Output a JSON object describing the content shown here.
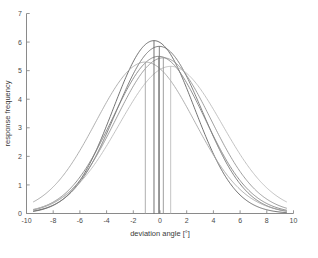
{
  "chart_data": {
    "type": "line",
    "title": "",
    "xlabel": "deviation angle [°]",
    "ylabel": "response frequency",
    "xlim": [
      -10,
      10
    ],
    "ylim": [
      0,
      7
    ],
    "xticks": [
      -10,
      -8,
      -6,
      -4,
      -2,
      0,
      2,
      4,
      6,
      8,
      10
    ],
    "xtick_labels": [
      "-10",
      "-8",
      "-6",
      "-4",
      "-2",
      "0",
      "2",
      "4",
      "6",
      "8",
      "10"
    ],
    "yticks": [
      0,
      1,
      2,
      3,
      4,
      5,
      6,
      7
    ],
    "ytick_labels": [
      "0",
      "1",
      "2",
      "3",
      "4",
      "5",
      "6",
      "7"
    ],
    "grid": false,
    "legend": "none",
    "x_domain_drawn": [
      -9.5,
      9.5
    ],
    "curve_shape": "gaussian",
    "series": [
      {
        "name": "curve-1",
        "mean": -0.45,
        "sigma": 3.05,
        "peak": 6.05,
        "color": "#5a5a5a",
        "mean_line": true
      },
      {
        "name": "curve-2",
        "mean": -0.05,
        "sigma": 3.25,
        "peak": 5.85,
        "color": "#6e6e6e",
        "mean_line": true
      },
      {
        "name": "curve-3",
        "mean": -0.1,
        "sigma": 3.45,
        "peak": 5.5,
        "color": "#7d7d7d",
        "mean_line": true
      },
      {
        "name": "curve-4",
        "mean": 0.25,
        "sigma": 3.55,
        "peak": 5.45,
        "color": "#8f8f8f",
        "mean_line": true
      },
      {
        "name": "curve-5",
        "mean": -1.1,
        "sigma": 3.7,
        "peak": 5.3,
        "color": "#a2a2a2",
        "mean_line": true
      },
      {
        "name": "curve-6",
        "mean": 0.8,
        "sigma": 3.85,
        "peak": 5.15,
        "color": "#b8b8b8",
        "mean_line": true
      }
    ],
    "axis_color": "#8a8a8a",
    "background_color": "#ffffff"
  },
  "figure": {
    "xlabel": "deviation angle [°]",
    "ylabel": "response frequency"
  }
}
